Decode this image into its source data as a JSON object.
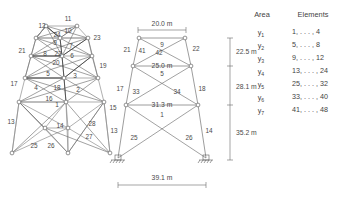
{
  "figure": {
    "title_present": false,
    "views": {
      "perspective": {
        "name": "3d-perspective-truss-view",
        "element_labels": [
          "11",
          "12",
          "10",
          "24",
          "23",
          "9",
          "7",
          "21",
          "8",
          "22",
          "6",
          "20",
          "19",
          "5",
          "3",
          "17",
          "4",
          "18",
          "2",
          "16",
          "1",
          "15",
          "13",
          "14",
          "28",
          "27",
          "25",
          "26"
        ]
      },
      "elevation": {
        "name": "2d-elevation-truss-view",
        "element_labels": [
          "9",
          "21",
          "41",
          "42",
          "22",
          "5",
          "17",
          "33",
          "34",
          "18",
          "1",
          "13",
          "25",
          "26",
          "14"
        ],
        "width_dims": [
          {
            "label": "20.0 m",
            "level": "top"
          },
          {
            "label": "25.0 m",
            "level": "upper-middle"
          },
          {
            "label": "31.3 m",
            "level": "lower-middle"
          },
          {
            "label": "39.1 m",
            "level": "base"
          }
        ],
        "height_dims": [
          {
            "label": "22.5 m"
          },
          {
            "label": "28.1 m"
          },
          {
            "label": "35.2 m"
          }
        ],
        "support_type": "pinned-support"
      }
    },
    "legend": {
      "headers": [
        "Area",
        "Elements"
      ],
      "rows": [
        {
          "area": "y",
          "area_sub": "1",
          "elements": "1, . . . , 4"
        },
        {
          "area": "y",
          "area_sub": "2",
          "elements": "5, . . . , 8"
        },
        {
          "area": "y",
          "area_sub": "3",
          "elements": "9, . . . , 12"
        },
        {
          "area": "y",
          "area_sub": "4",
          "elements": "13, . . . , 24"
        },
        {
          "area": "y",
          "area_sub": "5",
          "elements": "25, . . . , 32"
        },
        {
          "area": "y",
          "area_sub": "6",
          "elements": "33, . . . , 40"
        },
        {
          "area": "y",
          "area_sub": "7",
          "elements": "41, . . . , 48"
        }
      ]
    },
    "colors": {
      "background": "#ffffff",
      "member": "#8e8e8e",
      "member_dark": "#3a3a3a",
      "text": "#3f3f3f",
      "dimension": "#6a6a6a"
    }
  }
}
